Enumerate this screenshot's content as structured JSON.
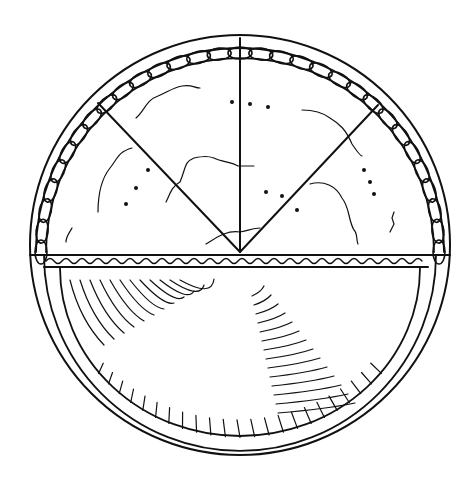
{
  "diagram": {
    "top_half": "pie viewed from above, cut into four slices, braided crust edge",
    "bottom_half": "pie cross-section showing pan, crust and filling",
    "slice_count": 4,
    "stroke_color": "#111111",
    "background_color": "#ffffff"
  }
}
